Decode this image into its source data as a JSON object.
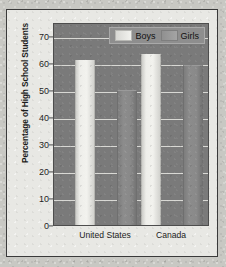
{
  "chart_data": {
    "type": "bar",
    "title": "",
    "subtitle": "",
    "xlabel": "",
    "ylabel": "Percentage of High School Students",
    "categories": [
      "United States",
      "Canada"
    ],
    "series": [
      {
        "name": "Boys",
        "values": [
          61,
          63
        ],
        "color": "#f2f2ee"
      },
      {
        "name": "Girls",
        "values": [
          50,
          59
        ],
        "color": "#8c8c8c"
      }
    ],
    "ylim": [
      0,
      75
    ],
    "yticks": [
      0,
      10,
      20,
      30,
      40,
      50,
      60,
      70
    ],
    "ytick_labels": [
      "0",
      "10",
      "20",
      "30",
      "40",
      "50",
      "60",
      "70"
    ],
    "grid": true,
    "grid_axis": "y",
    "legend": true,
    "legend_position": "top-right",
    "plot_background": "#7a7a7a",
    "gridline_color": "#d8d8d4",
    "figure_background": "#e8e8e4"
  },
  "axes": {
    "y_title": "Percentage of High School Students"
  },
  "legend": {
    "entries": [
      {
        "label": "Boys"
      },
      {
        "label": "Girls"
      }
    ]
  }
}
